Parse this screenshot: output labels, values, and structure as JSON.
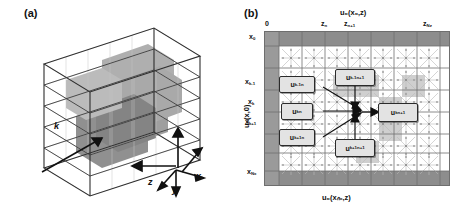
{
  "figure": {
    "panels": [
      {
        "tag": "(a)",
        "type": "3d-voxel-cube",
        "axes": [
          {
            "name": "x",
            "label": "x"
          },
          {
            "name": "y",
            "label": "y"
          },
          {
            "name": "z",
            "label": "z"
          },
          {
            "name": "k",
            "label": "k"
          }
        ],
        "description": "wireframe cube subdivided into voxels with darker shaded interior inclusion"
      },
      {
        "tag": "(b)",
        "type": "finite-difference-grid",
        "top_axis_label": "u₀(x₀,z)",
        "bottom_axis_label": "u₀(xₙₓ,z)",
        "left_axis_label": "u₀(x,0)",
        "top_ticks": [
          {
            "label": "0",
            "sub": ""
          },
          {
            "label": "z",
            "sub": "n"
          },
          {
            "label": "z",
            "sub": "n+1"
          },
          {
            "label": "z",
            "sub": "Nz"
          }
        ],
        "left_ticks": [
          {
            "label": "x",
            "sub": "0"
          },
          {
            "label": "x",
            "sub": "k-1"
          },
          {
            "label": "x",
            "sub": "k"
          },
          {
            "label": "x",
            "sub": "k+1"
          },
          {
            "label": "x",
            "sub": "Nx"
          }
        ],
        "stencil_nodes": [
          {
            "id": "u-k-minus-1-n",
            "base": "u",
            "sub": "k-1",
            "sup": "n"
          },
          {
            "id": "u-k-n",
            "base": "u",
            "sub": "k",
            "sup": "n"
          },
          {
            "id": "u-k-plus-1-n",
            "base": "u",
            "sub": "k+1",
            "sup": "n"
          },
          {
            "id": "u-k-minus-1-n-plus-1",
            "base": "u",
            "sub": "k-1",
            "sup": "n+1"
          },
          {
            "id": "u-k-n-plus-1",
            "base": "u",
            "sub": "k",
            "sup": "n+1"
          },
          {
            "id": "u-k-plus-1-n-plus-1",
            "base": "u",
            "sub": "k+1",
            "sup": "n+1"
          }
        ],
        "grid_columns": 8,
        "grid_rows": 7
      }
    ]
  },
  "colors": {
    "boundary_band": "#8d8d8d",
    "left_band": "#9a9a9a",
    "highlight_cell": "#cfcfcf",
    "node_fill": "#e3e3e3",
    "grid_line": "#7a7a7a",
    "ink": "#1a1a1a"
  }
}
